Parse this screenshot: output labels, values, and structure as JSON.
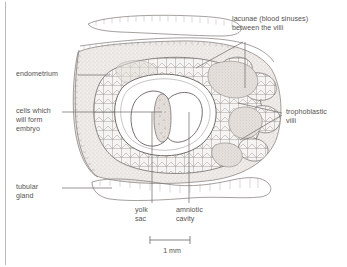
{
  "figure": {
    "type": "histological-diagram",
    "scale_bar": {
      "label": "1 mm",
      "length_px": 40
    }
  },
  "labels": {
    "lacunae": "lacunae (blood sinuses)\nbetween the villi",
    "endometrium": "endometrium",
    "cells_embryo": "cells which\nwill form\nembryo",
    "trophoblastic_villi": "trophoblastic\nvilli",
    "tubular_gland": "tubular\ngland",
    "yolk_sac": "yolk\nsac",
    "amniotic_cavity": "amniotic\ncavity"
  },
  "colors": {
    "ink": "#6d6a68",
    "ink_text": "#555252",
    "stipple": "#cfcbc6",
    "tissue_fill": "#e8e4df",
    "villi_fill": "#ded7d2",
    "lacunae_fill": "#d9d2cd",
    "frame": "#b9b9b9",
    "background": "#ffffff"
  }
}
